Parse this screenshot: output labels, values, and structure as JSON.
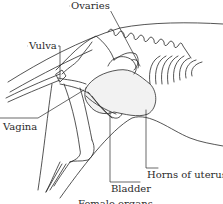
{
  "diagram": {
    "type": "anatomical-illustration",
    "labels": [
      {
        "id": "ovaries",
        "text": "Ovaries"
      },
      {
        "id": "vulva",
        "text": "Vulva"
      },
      {
        "id": "vagina",
        "text": "Vagina"
      },
      {
        "id": "bladder",
        "text": "Bladder"
      },
      {
        "id": "horns",
        "text": "Horns of uterus"
      }
    ],
    "caption": "Female organs",
    "colors": {
      "line": "#2a2a2a",
      "background": "#ffffff"
    }
  }
}
